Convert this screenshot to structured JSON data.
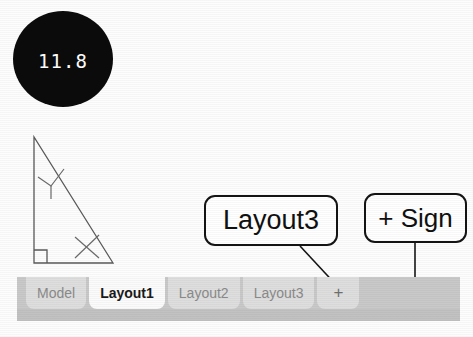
{
  "badge": {
    "value": "11.8",
    "bg_color": "#0b0b0b",
    "text_color": "#ffffff"
  },
  "figure": {
    "name": "right-triangle-diagram",
    "shape": "right triangle",
    "markers": [
      "right-angle-square",
      "angle-mark-y",
      "angle-mark-x"
    ],
    "stroke_color": "#5a5a5a"
  },
  "callouts": [
    {
      "id": "layout3",
      "label": "Layout3",
      "points_to": "tab-layout3",
      "leader": "diagonal"
    },
    {
      "id": "plus-sign",
      "label": "+ Sign",
      "points_to": "tab-add",
      "leader": "vertical"
    }
  ],
  "tabbar": {
    "bg_color": "#c9c9c9",
    "active_index": 1,
    "tabs": [
      {
        "label": "Model",
        "active": false
      },
      {
        "label": "Layout1",
        "active": true
      },
      {
        "label": "Layout2",
        "active": false
      },
      {
        "label": "Layout3",
        "active": false
      },
      {
        "label": "+",
        "active": false
      }
    ]
  }
}
